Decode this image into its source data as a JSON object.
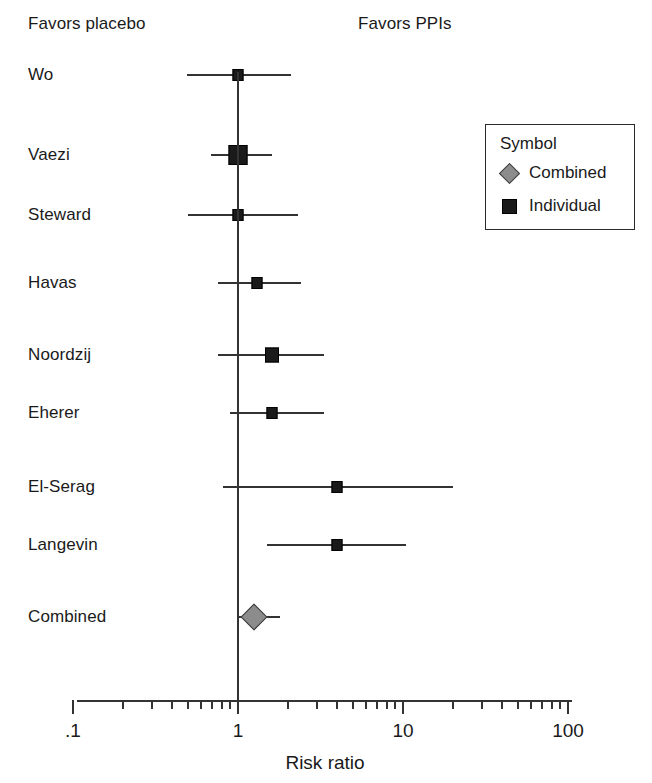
{
  "headers": {
    "left": "Favors placebo",
    "right": "Favors PPIs"
  },
  "legend": {
    "title": "Symbol",
    "items": [
      {
        "label": "Combined",
        "symbol": "diamond-icon",
        "color": "#8c8c8c"
      },
      {
        "label": "Individual",
        "symbol": "square-icon",
        "color": "#1a1a1a"
      }
    ]
  },
  "axis": {
    "title": "Risk ratio",
    "scale": "log",
    "tick_labels": [
      ".1",
      "1",
      "10",
      "100"
    ],
    "tick_values": [
      0.1,
      1,
      10,
      100
    ]
  },
  "chart_data": {
    "type": "forest",
    "title": "",
    "xlabel": "Risk ratio",
    "ylabel": "",
    "xscale": "log",
    "xlim": [
      0.1,
      100
    ],
    "xticks": [
      0.1,
      1,
      10,
      100
    ],
    "xticklabels": [
      ".1",
      "1",
      "10",
      "100"
    ],
    "minor_ticks": true,
    "grid": false,
    "reference_line": 1,
    "legend_position": "top-right",
    "left_annotation": "Favors placebo",
    "right_annotation": "Favors PPIs",
    "categories": [
      "Wo",
      "Vaezi",
      "Steward",
      "Havas",
      "Noordzij",
      "Eherer",
      "El-Serag",
      "Langevin",
      "Combined"
    ],
    "points": [
      {
        "study": "Wo",
        "rr": 1.0,
        "ci_low": 0.49,
        "ci_high": 2.1,
        "marker": "square",
        "weight": "small"
      },
      {
        "study": "Vaezi",
        "rr": 1.0,
        "ci_low": 0.69,
        "ci_high": 1.6,
        "marker": "square",
        "weight": "large"
      },
      {
        "study": "Steward",
        "rr": 1.0,
        "ci_low": 0.5,
        "ci_high": 2.3,
        "marker": "square",
        "weight": "small"
      },
      {
        "study": "Havas",
        "rr": 1.3,
        "ci_low": 0.76,
        "ci_high": 2.4,
        "marker": "square",
        "weight": "small"
      },
      {
        "study": "Noordzij",
        "rr": 1.6,
        "ci_low": 0.76,
        "ci_high": 3.3,
        "marker": "square",
        "weight": "medium"
      },
      {
        "study": "Eherer",
        "rr": 1.6,
        "ci_low": 0.89,
        "ci_high": 3.3,
        "marker": "square",
        "weight": "small"
      },
      {
        "study": "El-Serag",
        "rr": 4.0,
        "ci_low": 0.81,
        "ci_high": 20.0,
        "marker": "square",
        "weight": "small"
      },
      {
        "study": "Langevin",
        "rr": 4.0,
        "ci_low": 1.5,
        "ci_high": 10.5,
        "marker": "square",
        "weight": "small"
      },
      {
        "study": "Combined",
        "rr": 1.25,
        "ci_low": 1.0,
        "ci_high": 1.8,
        "marker": "diamond",
        "weight": "pooled"
      }
    ]
  },
  "layout": {
    "row_y": [
      75,
      155,
      215,
      283,
      355,
      413,
      487,
      545,
      617
    ],
    "label_x": 28,
    "axis_y": 700,
    "axis_x0": 77,
    "axis_x1": 572,
    "px_per_decade": 165,
    "x_at_1": 238,
    "vline_top": 72,
    "vline_bottom": 700,
    "marker_sizes": {
      "small": 11,
      "medium": 14,
      "large": 19,
      "pooled": 26
    },
    "legend_box": {
      "x": 485,
      "y": 124,
      "w": 150,
      "h": 106
    }
  }
}
